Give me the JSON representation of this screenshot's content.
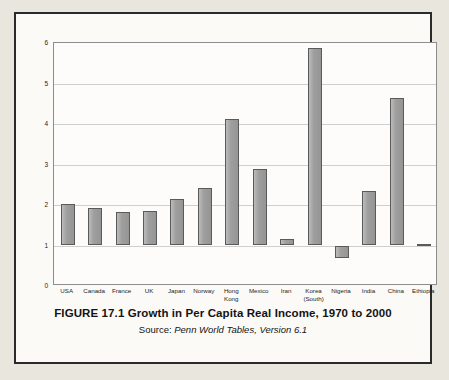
{
  "figure": {
    "caption_title": "FIGURE 17.1 Growth in Per Capita Real Income, 1970 to 2000",
    "source_label": "Source: ",
    "source_italic": "Penn World Tables, Version 6.1"
  },
  "colors": {
    "bar_fill": "#9e9e9e",
    "bar_border": "#5a5a5a",
    "gridline": "#cfcfcf",
    "plot_border": "#8d8d8d",
    "figure_border": "#2a2a2a",
    "page_background": "#e9e6de",
    "plot_background": "#fdfcfa",
    "text": "#1d1d1d"
  },
  "chart_data": {
    "type": "bar",
    "title": "FIGURE 17.1 Growth in Per Capita Real Income, 1970 to 2000",
    "subtitle": "Source: Penn World Tables, Version 6.1",
    "xlabel": "",
    "ylabel": "",
    "ylim": [
      0,
      6
    ],
    "yticks": [
      0,
      1,
      2,
      3,
      4,
      5,
      6
    ],
    "ytick_labels": [
      "0",
      "1",
      "2",
      "3",
      "4",
      "5",
      "6"
    ],
    "baseline": 1,
    "grid": true,
    "legend": false,
    "categories": [
      "USA",
      "Canada",
      "France",
      "UK",
      "Japan",
      "Norway",
      "Hong\nKong",
      "Mexico",
      "Iran",
      "Korea\n(South)",
      "Nigeria",
      "India",
      "China",
      "Ethiopia"
    ],
    "values": [
      2.03,
      1.92,
      1.82,
      1.85,
      2.16,
      2.43,
      4.12,
      2.9,
      1.16,
      5.88,
      0.7,
      2.35,
      4.65,
      1.03
    ]
  }
}
